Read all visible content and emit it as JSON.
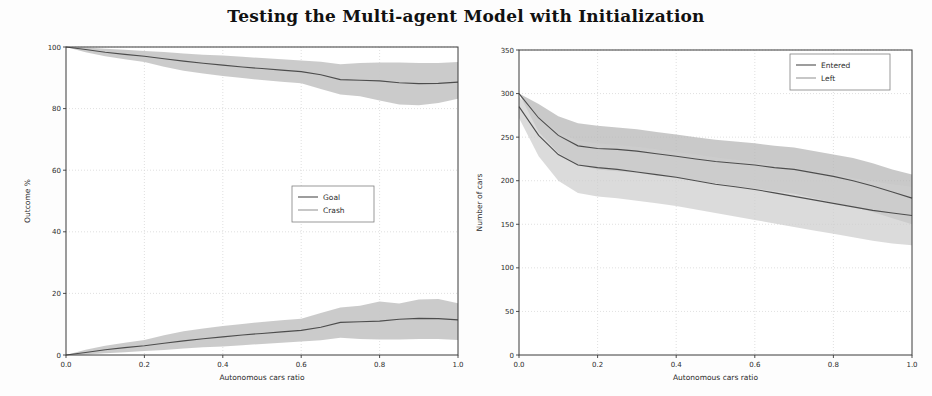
{
  "figure": {
    "title": "Testing the Multi-agent Model with Initialization",
    "background": "#fdfdfd",
    "panel_count": 2
  },
  "chart_data": [
    {
      "type": "line",
      "panel": "left",
      "title": "",
      "xlabel": "Autonomous cars ratio",
      "ylabel": "Outcome %",
      "xlim": [
        0.0,
        1.0
      ],
      "ylim": [
        0,
        100
      ],
      "xticks": [
        "0.0",
        "0.2",
        "0.4",
        "0.6",
        "0.8",
        "1.0"
      ],
      "yticks": [
        "0",
        "20",
        "40",
        "60",
        "80",
        "100"
      ],
      "grid": true,
      "legend_position": "center-right",
      "legend": [
        "Goal",
        "Crash"
      ],
      "line_color": "#4d4d4d",
      "band_color": "#c4c4c4",
      "x": [
        0.0,
        0.05,
        0.1,
        0.15,
        0.2,
        0.25,
        0.3,
        0.35,
        0.4,
        0.45,
        0.5,
        0.55,
        0.6,
        0.65,
        0.7,
        0.75,
        0.8,
        0.85,
        0.9,
        0.95,
        1.0
      ],
      "series": [
        {
          "name": "Goal",
          "values": [
            100.0,
            99.2,
            98.3,
            97.6,
            97.0,
            96.2,
            95.4,
            94.7,
            94.1,
            93.5,
            93.0,
            92.5,
            92.0,
            91.0,
            89.4,
            89.2,
            89.0,
            88.4,
            88.1,
            88.2,
            88.6
          ],
          "band_lower": [
            100.0,
            98.3,
            97.0,
            96.0,
            95.1,
            93.6,
            92.3,
            91.4,
            90.6,
            89.9,
            89.3,
            88.7,
            88.2,
            86.4,
            84.6,
            84.0,
            82.6,
            81.3,
            81.1,
            81.8,
            83.2
          ],
          "band_upper": [
            100.0,
            99.8,
            99.4,
            99.1,
            98.7,
            98.4,
            97.9,
            97.5,
            97.2,
            96.8,
            96.4,
            96.0,
            95.6,
            95.2,
            94.4,
            94.8,
            95.0,
            95.0,
            94.8,
            94.8,
            95.1
          ]
        },
        {
          "name": "Crash",
          "values": [
            0.0,
            0.8,
            1.7,
            2.4,
            3.0,
            3.8,
            4.6,
            5.3,
            5.9,
            6.5,
            7.0,
            7.5,
            8.0,
            9.0,
            10.6,
            10.8,
            11.0,
            11.6,
            11.9,
            11.8,
            11.4
          ],
          "band_lower": [
            0.0,
            0.2,
            0.6,
            0.9,
            1.3,
            1.6,
            2.1,
            2.5,
            2.8,
            3.2,
            3.6,
            4.0,
            4.4,
            4.8,
            5.6,
            5.2,
            5.0,
            5.0,
            5.2,
            5.2,
            4.9
          ],
          "band_upper": [
            0.0,
            1.7,
            3.0,
            4.0,
            4.9,
            6.4,
            7.7,
            8.6,
            9.4,
            10.1,
            10.7,
            11.3,
            11.8,
            13.6,
            15.4,
            16.0,
            17.4,
            16.7,
            18.0,
            18.2,
            16.8
          ]
        }
      ]
    },
    {
      "type": "line",
      "panel": "right",
      "title": "",
      "xlabel": "Autonomous cars ratio",
      "ylabel": "Number of cars",
      "xlim": [
        0.0,
        1.0
      ],
      "ylim": [
        0,
        350
      ],
      "xticks": [
        "0.0",
        "0.2",
        "0.4",
        "0.6",
        "0.8",
        "1.0"
      ],
      "yticks": [
        "0",
        "50",
        "100",
        "150",
        "200",
        "250",
        "300",
        "350"
      ],
      "grid": true,
      "legend_position": "upper-right",
      "legend": [
        "Entered",
        "Left"
      ],
      "line_color": "#4d4d4d",
      "band_color_entered": "#b4b4b4",
      "band_color_left": "#cdcdcd",
      "x": [
        0.0,
        0.05,
        0.1,
        0.15,
        0.2,
        0.25,
        0.3,
        0.35,
        0.4,
        0.45,
        0.5,
        0.55,
        0.6,
        0.65,
        0.7,
        0.75,
        0.8,
        0.85,
        0.9,
        0.95,
        1.0
      ],
      "series": [
        {
          "name": "Entered",
          "values": [
            300,
            272,
            252,
            240,
            237,
            236,
            234,
            231,
            228,
            225,
            222,
            220,
            218,
            215,
            213,
            209,
            205,
            200,
            194,
            187,
            180
          ],
          "band_lower": [
            300,
            256,
            232,
            218,
            213,
            211,
            209,
            206,
            203,
            200,
            197,
            194,
            191,
            188,
            185,
            180,
            175,
            170,
            164,
            157,
            150
          ],
          "band_upper": [
            300,
            288,
            274,
            266,
            263,
            261,
            259,
            256,
            253,
            250,
            247,
            245,
            243,
            240,
            238,
            234,
            230,
            226,
            220,
            213,
            207
          ]
        },
        {
          "name": "Left",
          "values": [
            285,
            252,
            230,
            218,
            215,
            213,
            210,
            207,
            204,
            200,
            196,
            193,
            190,
            186,
            182,
            178,
            174,
            170,
            166,
            163,
            160
          ],
          "band_lower": [
            272,
            228,
            200,
            186,
            182,
            180,
            177,
            174,
            171,
            167,
            163,
            159,
            155,
            151,
            147,
            143,
            139,
            135,
            131,
            128,
            126
          ],
          "band_upper": [
            296,
            274,
            256,
            246,
            243,
            241,
            239,
            236,
            233,
            230,
            227,
            224,
            221,
            218,
            215,
            211,
            207,
            203,
            199,
            196,
            193
          ]
        }
      ]
    }
  ],
  "left_panel": {
    "name": "left-plot",
    "xlabel": "Autonomous cars ratio",
    "ylabel": "Outcome %",
    "legend_items": [
      {
        "label": "Goal"
      },
      {
        "label": "Crash"
      }
    ],
    "xticks": [
      "0.0",
      "0.2",
      "0.4",
      "0.6",
      "0.8",
      "1.0"
    ],
    "yticks": [
      "0",
      "20",
      "40",
      "60",
      "80",
      "100"
    ]
  },
  "right_panel": {
    "name": "right-plot",
    "xlabel": "Autonomous cars ratio",
    "ylabel": "Number of cars",
    "legend_items": [
      {
        "label": "Entered"
      },
      {
        "label": "Left"
      }
    ],
    "xticks": [
      "0.0",
      "0.2",
      "0.4",
      "0.6",
      "0.8",
      "1.0"
    ],
    "yticks": [
      "0",
      "50",
      "100",
      "150",
      "200",
      "250",
      "300",
      "350"
    ]
  },
  "colors": {
    "line": "#4d4d4d",
    "band_light": "#c8c8c8",
    "band_dark": "#a8a8a8",
    "axis": "#3a3a3a",
    "grid": "#d8d8d8",
    "text": "#2b2b2b",
    "background": "#fdfdfd"
  }
}
